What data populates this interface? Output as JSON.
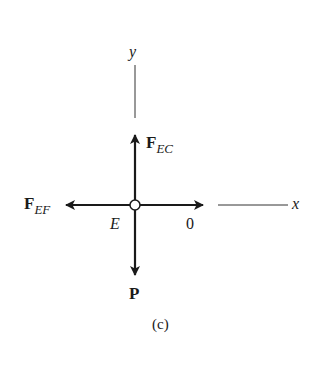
{
  "diagram": {
    "type": "free-body-diagram",
    "caption": "(c)",
    "node": {
      "label": "E"
    },
    "axes": {
      "x_label": "x",
      "y_label": "y"
    },
    "forces": [
      {
        "name": "F",
        "subscript": "EC",
        "direction": "up"
      },
      {
        "name": "F",
        "subscript": "EF",
        "direction": "left"
      },
      {
        "name": "P",
        "subscript": "",
        "direction": "down"
      },
      {
        "name": "0",
        "subscript": "",
        "direction": "right"
      }
    ],
    "colors": {
      "ink": "#1a1a1a",
      "background": "#ffffff"
    }
  }
}
